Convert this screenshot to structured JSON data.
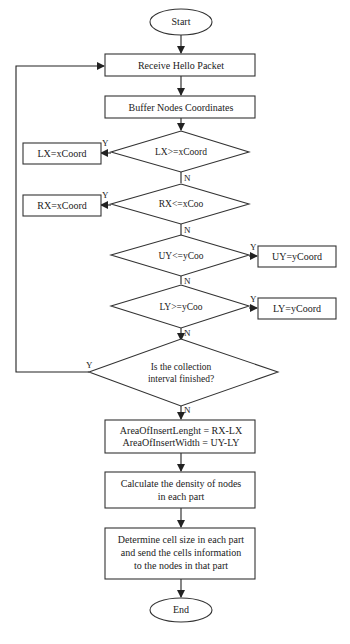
{
  "diagram": {
    "type": "flowchart",
    "nodes": {
      "start": {
        "shape": "ellipse",
        "label": "Start"
      },
      "receive": {
        "shape": "rect",
        "label": "Receive Hello Packet"
      },
      "buffer": {
        "shape": "rect",
        "label": "Buffer Nodes Coordinates"
      },
      "d_lx": {
        "shape": "diamond",
        "label": "LX>=xCoord"
      },
      "set_lx": {
        "shape": "rect",
        "label": "LX=xCoord"
      },
      "d_rx": {
        "shape": "diamond",
        "label": "RX<=xCoo"
      },
      "set_rx": {
        "shape": "rect",
        "label": "RX=xCoord"
      },
      "d_uy": {
        "shape": "diamond",
        "label": "UY<=yCoo"
      },
      "set_uy": {
        "shape": "rect",
        "label": "UY=yCoord"
      },
      "d_ly": {
        "shape": "diamond",
        "label": "LY>=yCoo"
      },
      "set_ly": {
        "shape": "rect",
        "label": "LY=yCoord"
      },
      "d_interval": {
        "shape": "diamond",
        "lines": [
          "Is the collection",
          "interval finished?"
        ]
      },
      "area": {
        "shape": "rect",
        "lines": [
          "AreaOfInsertLenght = RX-LX",
          "AreaOfInsertWidth = UY-LY"
        ]
      },
      "density": {
        "shape": "rect",
        "lines": [
          "Calculate the density of nodes",
          "in each part"
        ]
      },
      "cellsize": {
        "shape": "rect",
        "lines": [
          "Determine cell size in each part",
          "and send the cells information",
          "to the nodes in that part"
        ]
      },
      "end": {
        "shape": "ellipse",
        "label": "End"
      }
    },
    "edge_labels": {
      "yes": "Y",
      "no": "N"
    },
    "edges": [
      {
        "from": "start",
        "to": "receive"
      },
      {
        "from": "receive",
        "to": "buffer"
      },
      {
        "from": "buffer",
        "to": "d_lx"
      },
      {
        "from": "d_lx",
        "to": "set_lx",
        "label": "Y"
      },
      {
        "from": "d_lx",
        "to": "d_rx",
        "label": "N"
      },
      {
        "from": "d_rx",
        "to": "set_rx",
        "label": "Y"
      },
      {
        "from": "d_rx",
        "to": "d_uy",
        "label": "N"
      },
      {
        "from": "d_uy",
        "to": "set_uy",
        "label": "Y"
      },
      {
        "from": "d_uy",
        "to": "d_ly",
        "label": "N"
      },
      {
        "from": "d_ly",
        "to": "set_ly",
        "label": "Y"
      },
      {
        "from": "d_ly",
        "to": "d_interval",
        "label": "N"
      },
      {
        "from": "d_interval",
        "to": "receive",
        "label": "Y"
      },
      {
        "from": "d_interval",
        "to": "area",
        "label": "N"
      },
      {
        "from": "area",
        "to": "density"
      },
      {
        "from": "density",
        "to": "cellsize"
      },
      {
        "from": "cellsize",
        "to": "end"
      }
    ]
  }
}
